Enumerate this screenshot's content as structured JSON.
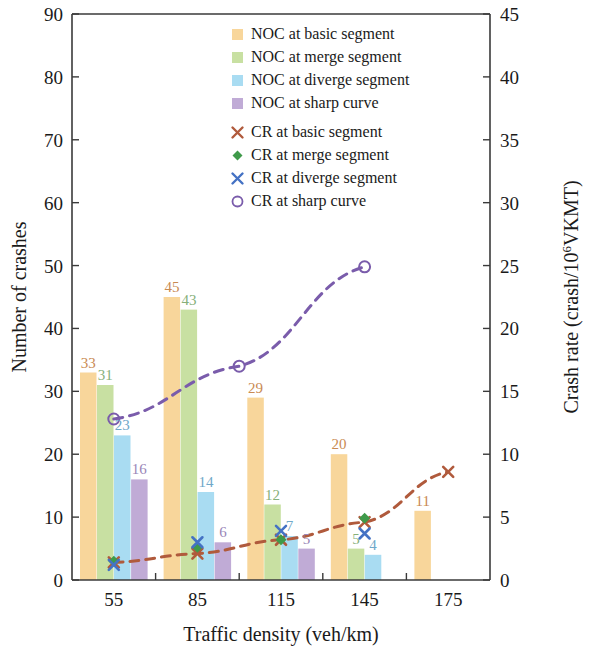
{
  "chart_data": {
    "type": "bar",
    "title": "",
    "xlabel": "Traffic density (veh/km)",
    "ylabel": "Number of crashes",
    "y2label": "Crash rate (crash/10⁶VKMT)",
    "categories": [
      "55",
      "85",
      "115",
      "145",
      "175"
    ],
    "x_tick_labels": [
      "55",
      "85",
      "115",
      "145",
      "175"
    ],
    "y_tick_labels": [
      "0",
      "10",
      "20",
      "30",
      "40",
      "50",
      "60",
      "70",
      "80",
      "90"
    ],
    "y2_tick_labels": [
      "0",
      "5",
      "10",
      "15",
      "20",
      "25",
      "30",
      "35",
      "40",
      "45"
    ],
    "ylim": [
      0,
      90
    ],
    "y2lim": [
      0,
      45
    ],
    "grid": false,
    "legend_position": "upper-right-inside",
    "bar_series": [
      {
        "name": "NOC at basic segment",
        "legend_label": "NOC at basic segment",
        "color": "#f8d69b",
        "label_color": "#c98a52",
        "values": [
          33,
          45,
          29,
          20,
          11
        ],
        "value_labels": [
          "33",
          "45",
          "29",
          "20",
          "11"
        ]
      },
      {
        "name": "NOC at merge segment",
        "legend_label": "NOC at merge segment",
        "color": "#c8e0a2",
        "label_color": "#86b07a",
        "values": [
          31,
          43,
          12,
          5,
          null
        ],
        "value_labels": [
          "31",
          "43",
          "12",
          "5",
          ""
        ]
      },
      {
        "name": "NOC at diverge segment",
        "legend_label": "NOC at diverge segment",
        "color": "#a9dcf2",
        "label_color": "#6fa8c9",
        "values": [
          23,
          14,
          7,
          4,
          null
        ],
        "value_labels": [
          "23",
          "14",
          "7",
          "4",
          ""
        ]
      },
      {
        "name": "NOC at sharp curve",
        "legend_label": "NOC at sharp curve",
        "color": "#c0abd6",
        "label_color": "#9a86b8",
        "values": [
          16,
          6,
          5,
          null,
          null
        ],
        "value_labels": [
          "16",
          "6",
          "5",
          "",
          ""
        ]
      }
    ],
    "line_series": [
      {
        "name": "CR at basic segment",
        "legend_label": "CR at basic segment",
        "color": "#b05a3c",
        "marker": "x",
        "values": [
          1.4,
          2.1,
          3.2,
          4.6,
          8.6
        ]
      },
      {
        "name": "CR at merge segment",
        "legend_label": "CR at merge segment",
        "color": "#3f9a4a",
        "marker": "diamond",
        "values": [
          1.5,
          2.6,
          3.2,
          4.9,
          null
        ]
      },
      {
        "name": "CR at diverge segment",
        "legend_label": "CR at diverge segment",
        "color": "#4472c4",
        "marker": "x",
        "values": [
          1.2,
          3.0,
          3.9,
          3.7,
          null
        ]
      },
      {
        "name": "CR at sharp curve",
        "legend_label": "CR at sharp curve",
        "color": "#7a5cab",
        "marker": "circle",
        "values": [
          12.8,
          null,
          17.0,
          null,
          24.9
        ],
        "x_positions": [
          55,
          100,
          145
        ],
        "note": "markers plotted at density 55, 100 and 145"
      }
    ]
  },
  "axes": {
    "left_title": "Number of crashes",
    "right_title": "Crash rate (crash/10⁶VKMT)",
    "bottom_title": "Traffic density (veh/km)"
  },
  "legend": {
    "items": [
      {
        "label": "NOC at basic segment",
        "swatch": "#f8d69b",
        "kind": "square"
      },
      {
        "label": "NOC at merge segment",
        "swatch": "#c8e0a2",
        "kind": "square"
      },
      {
        "label": "NOC at diverge segment",
        "swatch": "#a9dcf2",
        "kind": "square"
      },
      {
        "label": "NOC at sharp curve",
        "swatch": "#c0abd6",
        "kind": "square"
      },
      {
        "label": "CR at basic segment",
        "swatch": "#b05a3c",
        "kind": "x"
      },
      {
        "label": "CR at merge segment",
        "swatch": "#3f9a4a",
        "kind": "diamond"
      },
      {
        "label": "CR at diverge segment",
        "swatch": "#4472c4",
        "kind": "x"
      },
      {
        "label": "CR at sharp curve",
        "swatch": "#7a5cab",
        "kind": "circle"
      }
    ]
  }
}
